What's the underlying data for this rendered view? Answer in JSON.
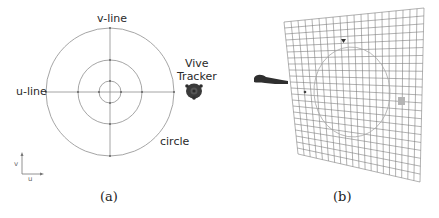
{
  "figure": {
    "panel_a": {
      "caption": "(a)",
      "labels": {
        "v_line": "v-line",
        "u_line": "u-line",
        "tracker_line1": "Vive",
        "tracker_line2": "Tracker",
        "circle": "circle",
        "axis_v": "v",
        "axis_u": "u"
      },
      "circles": {
        "center": [
          110,
          92
        ],
        "radii": [
          64,
          32,
          11
        ]
      },
      "line_color": "#8a8a8a"
    },
    "panel_b": {
      "caption": "(b)",
      "grid": {
        "corners": {
          "top_left": [
            64,
            22
          ],
          "top_right": [
            204,
            8
          ],
          "bottom_right": [
            200,
            182
          ],
          "bottom_left": [
            78,
            154
          ]
        },
        "columns": 20,
        "rows": 22,
        "color": "#7a7a7a"
      }
    }
  }
}
